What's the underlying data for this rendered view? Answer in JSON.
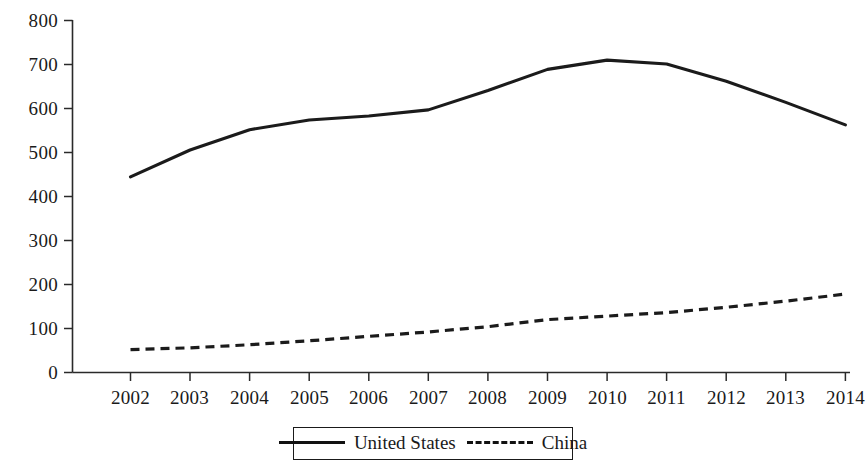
{
  "chart_data": {
    "type": "line",
    "title": "",
    "subtitle": "",
    "xlabel": "",
    "ylabel": "",
    "x": [
      2002,
      2003,
      2004,
      2005,
      2006,
      2007,
      2008,
      2009,
      2010,
      2011,
      2012,
      2013,
      2014
    ],
    "categories": [
      "2002",
      "2003",
      "2004",
      "2005",
      "2006",
      "2007",
      "2008",
      "2009",
      "2010",
      "2011",
      "2012",
      "2013",
      "2014"
    ],
    "series": [
      {
        "name": "United States",
        "style": "solid",
        "color": "#1b1b1b",
        "values": [
          444,
          505,
          551,
          573,
          582,
          596,
          640,
          688,
          709,
          700,
          661,
          613,
          562
        ]
      },
      {
        "name": "China",
        "style": "dashed",
        "color": "#1b1b1b",
        "values": [
          52,
          56,
          63,
          72,
          82,
          92,
          104,
          120,
          128,
          136,
          148,
          162,
          178
        ]
      }
    ],
    "ylim": [
      0,
      800
    ],
    "yticks": [
      0,
      100,
      200,
      300,
      400,
      500,
      600,
      700,
      800
    ],
    "ytick_labels": [
      "0",
      "100",
      "200",
      "300",
      "400",
      "500",
      "600",
      "700",
      "800"
    ],
    "xlim": [
      2002,
      2014
    ],
    "grid": false,
    "legend": {
      "position": "bottom-center",
      "bordered": true,
      "entries": [
        {
          "label": "United States",
          "style": "solid"
        },
        {
          "label": "China",
          "style": "dashed"
        }
      ]
    },
    "axis_color": "#2a2a2a",
    "background": "#ffffff"
  }
}
